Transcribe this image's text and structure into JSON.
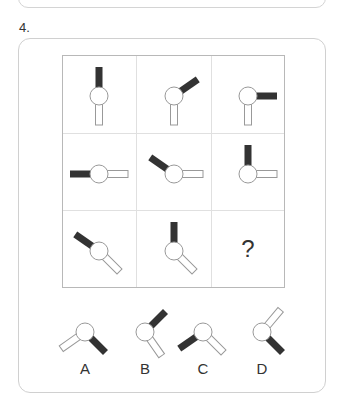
{
  "question": {
    "number": "4."
  },
  "grid": {
    "cells": [
      {
        "row": 1,
        "col": 1,
        "dark_angle": 0,
        "light_angle": 180
      },
      {
        "row": 1,
        "col": 2,
        "dark_angle": 55,
        "light_angle": 180
      },
      {
        "row": 1,
        "col": 3,
        "dark_angle": 90,
        "light_angle": 180
      },
      {
        "row": 2,
        "col": 1,
        "dark_angle": 270,
        "light_angle": 90
      },
      {
        "row": 2,
        "col": 2,
        "dark_angle": 305,
        "light_angle": 90
      },
      {
        "row": 2,
        "col": 3,
        "dark_angle": 0,
        "light_angle": 90
      },
      {
        "row": 3,
        "col": 1,
        "dark_angle": 305,
        "light_angle": 135
      },
      {
        "row": 3,
        "col": 2,
        "dark_angle": 0,
        "light_angle": 135
      },
      {
        "row": 3,
        "col": 3,
        "missing": true,
        "label": "?"
      }
    ]
  },
  "options": [
    {
      "label": "A",
      "dark_angle": 135,
      "light_angle": 235
    },
    {
      "label": "B",
      "dark_angle": 45,
      "light_angle": 145
    },
    {
      "label": "C",
      "dark_angle": 235,
      "light_angle": 135
    },
    {
      "label": "D",
      "dark_angle": 135,
      "light_angle": 40
    }
  ],
  "colors": {
    "dark_arm": "#333333",
    "light_arm_stroke": "#999999",
    "circle_stroke": "#999999"
  }
}
